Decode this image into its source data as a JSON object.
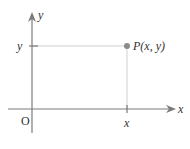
{
  "diagram": {
    "type": "coordinate-plane",
    "colors": {
      "axis": "#7a7a7a",
      "guide": "#cfcfcf",
      "point": "#8a8a8a",
      "text": "#333333"
    },
    "axes": {
      "x_label": "x",
      "y_label": "y",
      "origin_label": "O"
    },
    "point": {
      "label": "P(x, y)",
      "x_tick_label": "x",
      "y_tick_label": "y"
    }
  }
}
